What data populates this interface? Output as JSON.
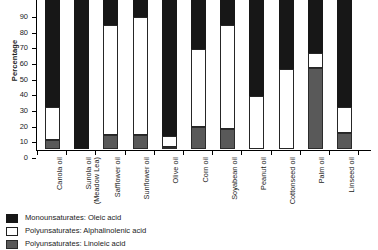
{
  "chart_data": {
    "type": "bar",
    "stacked": true,
    "title": "",
    "xlabel": "",
    "ylabel": "Percentage",
    "ylim": [
      0,
      100
    ],
    "yticks": [
      0,
      10,
      20,
      30,
      40,
      50,
      60,
      70,
      80,
      90
    ],
    "grid": false,
    "legend_position": "bottom-left",
    "categories": [
      "Canola oil",
      "Sunola oil\n(Meadow Lea)",
      "Safflower oil",
      "Sunflower oil",
      "Olive oil",
      "Corn oil",
      "Soyabean oil",
      "Peanut oil",
      "Cottonseed oil",
      "Palm oil",
      "Linseed oil"
    ],
    "series": [
      {
        "name": "Polyunsaturates: Linoleic acid",
        "color": "#595959",
        "values": [
          6,
          0,
          9,
          9,
          1,
          14,
          13,
          0,
          0,
          52,
          10
        ]
      },
      {
        "name": "Polyunsaturates: Alphalinolenic acid",
        "color": "#ffffff",
        "values": [
          21,
          0,
          70,
          75,
          7,
          50,
          66,
          34,
          51,
          9,
          17
        ]
      },
      {
        "name": "Monounsaturates: Oleic acid",
        "color": "#171717",
        "values": [
          73,
          100,
          21,
          16,
          92,
          36,
          21,
          66,
          49,
          39,
          73
        ]
      }
    ]
  },
  "legend": {
    "items": [
      {
        "label": "Monounsaturates: Oleic acid",
        "swatch": "oleic"
      },
      {
        "label": "Polyunsaturates: Alphalinolenic acid",
        "swatch": "alpha"
      },
      {
        "label": "Polyunsaturates: Linoleic acid",
        "swatch": "lino"
      }
    ]
  }
}
